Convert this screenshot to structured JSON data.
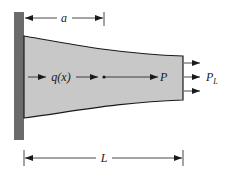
{
  "diagram": {
    "type": "tapered-bar-axial-load",
    "colors": {
      "wall": "#6b6b6b",
      "bar_fill": "#c8c8c8",
      "outline": "#1a1a1a",
      "background": "#ffffff"
    },
    "labels": {
      "a": "a",
      "distributed_load": "q(x)",
      "internal_force": "P",
      "end_load_main": "P",
      "end_load_sub": "L",
      "length": "L"
    }
  }
}
